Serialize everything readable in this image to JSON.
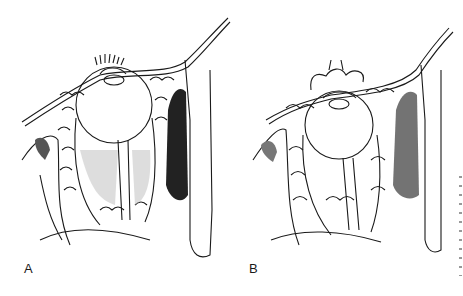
{
  "figure": {
    "panels": [
      {
        "label": "A",
        "description": "Sagittal section of orbit with eyeball, extraocular muscles, orbital fat and dark-shaded maxillary sinus; eyelids closed with eyelashes"
      },
      {
        "label": "B",
        "description": "Sagittal section of orbit with eyeball, lobulated orbital fat and lighter-shaded maxillary sinus; eyelids everted/retracted"
      }
    ],
    "colors": {
      "ink": "#1a1a1a",
      "background": "#ffffff",
      "shading": "#2a2a2a"
    }
  }
}
